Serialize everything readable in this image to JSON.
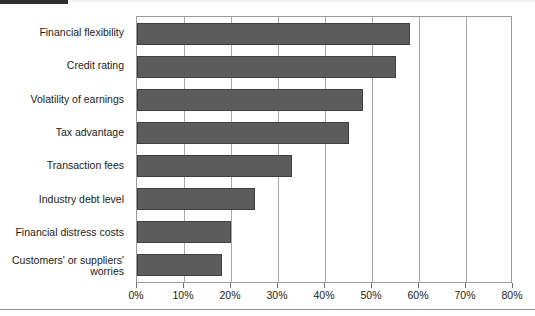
{
  "chart_data": {
    "type": "bar",
    "orientation": "horizontal",
    "title": "",
    "subtitle": "",
    "xlabel": "",
    "ylabel": "",
    "xlim": [
      0,
      80
    ],
    "xtick_step": 10,
    "grid": true,
    "legend": null,
    "categories": [
      "Financial flexibility",
      "Credit rating",
      "Volatility of earnings",
      "Tax advantage",
      "Transaction fees",
      "Industry debt level",
      "Financial distress costs",
      "Customers' or suppliers'\nworries"
    ],
    "values": [
      58,
      55,
      48,
      45,
      33,
      25,
      20,
      18
    ],
    "value_unit": "%",
    "xticks": [
      "0%",
      "10%",
      "20%",
      "30%",
      "40%",
      "50%",
      "60%",
      "70%",
      "80%"
    ],
    "xtick_values": [
      0,
      10,
      20,
      30,
      40,
      50,
      60,
      70,
      80
    ],
    "colors": {
      "bar_fill": "#5c5c5c",
      "bar_border": "#3f3f3f",
      "gridline": "#a8a8a8",
      "frame": "#9a9a9a",
      "text": "#1b1b1b",
      "background": "#ffffff"
    }
  }
}
